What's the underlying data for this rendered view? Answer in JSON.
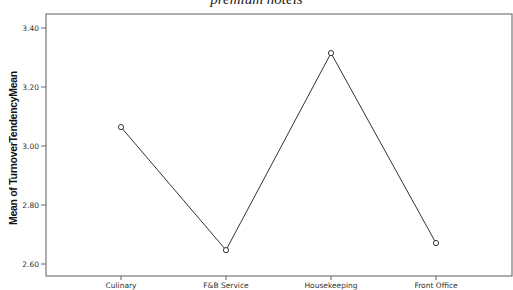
{
  "chart_data": {
    "type": "line",
    "title": "premium hotels",
    "xlabel": "",
    "ylabel": "Mean of TurnoverTendencyMean",
    "categories": [
      "Culinary",
      "F&B Service",
      "Housekeeping",
      "Front Office"
    ],
    "series": [
      {
        "name": "Mean of TurnoverTendencyMean",
        "values": [
          3.064,
          2.647,
          3.315,
          2.671
        ]
      }
    ],
    "ylim": [
      2.56,
      3.44
    ],
    "yticks": [
      "2.60",
      "2.80",
      "3.00",
      "3.20",
      "3.40"
    ],
    "grid": false,
    "legend": null,
    "marker": "open-circle",
    "line_color": "#333333"
  }
}
